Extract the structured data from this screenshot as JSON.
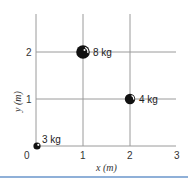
{
  "diagram": {
    "x_axis": {
      "label": "x (m)",
      "ticks": [
        "0",
        "1",
        "2",
        "3"
      ]
    },
    "y_axis": {
      "label": "y (m)",
      "ticks": [
        "1",
        "2"
      ]
    },
    "masses": [
      {
        "label": "3 kg",
        "x": 0,
        "y": 0
      },
      {
        "label": "8 kg",
        "x": 1,
        "y": 2
      },
      {
        "label": "4 kg",
        "x": 2,
        "y": 1
      }
    ],
    "colors": {
      "grid": "#9a9a9a",
      "ball": "#111111",
      "rule": "#8fb0d8"
    }
  }
}
